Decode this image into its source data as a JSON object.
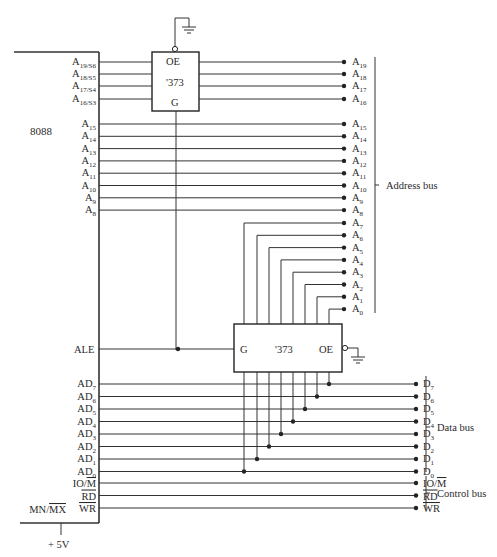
{
  "cpu": {
    "name": "8088",
    "high_pins": [
      {
        "base": "A",
        "sub": "19/S6"
      },
      {
        "base": "A",
        "sub": "18/S5"
      },
      {
        "base": "A",
        "sub": "17/S4"
      },
      {
        "base": "A",
        "sub": "16/S3"
      }
    ],
    "mid_pins": [
      {
        "base": "A",
        "sub": "15"
      },
      {
        "base": "A",
        "sub": "14"
      },
      {
        "base": "A",
        "sub": "13"
      },
      {
        "base": "A",
        "sub": "12"
      },
      {
        "base": "A",
        "sub": "11"
      },
      {
        "base": "A",
        "sub": "10"
      },
      {
        "base": "A",
        "sub": "9"
      },
      {
        "base": "A",
        "sub": "8"
      }
    ],
    "ale_pin": "ALE",
    "ad_pins": [
      {
        "base": "AD",
        "sub": "7"
      },
      {
        "base": "AD",
        "sub": "6"
      },
      {
        "base": "AD",
        "sub": "5"
      },
      {
        "base": "AD",
        "sub": "4"
      },
      {
        "base": "AD",
        "sub": "3"
      },
      {
        "base": "AD",
        "sub": "2"
      },
      {
        "base": "AD",
        "sub": "1"
      },
      {
        "base": "AD",
        "sub": "0"
      }
    ],
    "ctrl_pins": {
      "io_m": {
        "pre": "IO/",
        "bar": "M"
      },
      "rd": {
        "bar": "RD"
      },
      "wr": {
        "bar": "WR"
      }
    },
    "mn_mx": {
      "pre": "MN/",
      "bar": "MX"
    },
    "supply": "+ 5V"
  },
  "latch_top": {
    "oe": "OE",
    "part": "'373",
    "g": "G"
  },
  "latch_bottom": {
    "g": "G",
    "part": "'373",
    "oe": "OE"
  },
  "address_outputs": [
    {
      "base": "A",
      "sub": "19"
    },
    {
      "base": "A",
      "sub": "18"
    },
    {
      "base": "A",
      "sub": "17"
    },
    {
      "base": "A",
      "sub": "16"
    },
    {
      "base": "A",
      "sub": "15"
    },
    {
      "base": "A",
      "sub": "14"
    },
    {
      "base": "A",
      "sub": "13"
    },
    {
      "base": "A",
      "sub": "12"
    },
    {
      "base": "A",
      "sub": "11"
    },
    {
      "base": "A",
      "sub": "10"
    },
    {
      "base": "A",
      "sub": "9"
    },
    {
      "base": "A",
      "sub": "8"
    },
    {
      "base": "A",
      "sub": "7"
    },
    {
      "base": "A",
      "sub": "6"
    },
    {
      "base": "A",
      "sub": "5"
    },
    {
      "base": "A",
      "sub": "4"
    },
    {
      "base": "A",
      "sub": "3"
    },
    {
      "base": "A",
      "sub": "2"
    },
    {
      "base": "A",
      "sub": "1"
    },
    {
      "base": "A",
      "sub": "0"
    }
  ],
  "data_outputs": [
    {
      "base": "D",
      "sub": "7"
    },
    {
      "base": "D",
      "sub": "6"
    },
    {
      "base": "D",
      "sub": "5"
    },
    {
      "base": "D",
      "sub": "4"
    },
    {
      "base": "D",
      "sub": "3"
    },
    {
      "base": "D",
      "sub": "2"
    },
    {
      "base": "D",
      "sub": "1"
    },
    {
      "base": "D",
      "sub": "0"
    }
  ],
  "control_outputs": {
    "io_m": {
      "pre": "IO/",
      "bar": "M"
    },
    "rd": {
      "bar": "RD"
    },
    "wr": {
      "bar": "WR"
    }
  },
  "bus_labels": {
    "address": "Address bus",
    "data": "Data bus",
    "control": "Control bus"
  }
}
